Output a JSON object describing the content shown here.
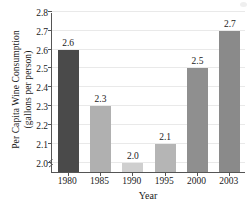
{
  "chart_data": {
    "type": "bar",
    "title": "",
    "subtitle": "",
    "xlabel": "Year",
    "ylabel_line1": "Per Capita Wine Consumption",
    "ylabel_line2": "(gallons per person)",
    "categories": [
      "1980",
      "1985",
      "1990",
      "1995",
      "2000",
      "2003"
    ],
    "values": [
      2.6,
      2.3,
      2.0,
      2.1,
      2.5,
      2.7
    ],
    "value_labels": [
      "2.6",
      "2.3",
      "2.0",
      "2.1",
      "2.5",
      "2.7"
    ],
    "bar_colors": [
      "#4a4a4a",
      "#b0b0b0",
      "#cfcfcf",
      "#b5b5b5",
      "#8f8f8f",
      "#8a8a8a"
    ],
    "ylim": [
      1.95,
      2.8
    ],
    "yticks": [
      2.0,
      2.1,
      2.2,
      2.3,
      2.4,
      2.5,
      2.6,
      2.7,
      2.8
    ],
    "ytick_labels": [
      "2.0",
      "2.1",
      "2.2",
      "2.3",
      "2.4",
      "2.5",
      "2.6",
      "2.7",
      "2.8"
    ],
    "grid": true,
    "grid_color": "#e9e9e9",
    "axis_color": "#555555",
    "axis_break": true,
    "legend": "none",
    "background": "#ffffff"
  }
}
